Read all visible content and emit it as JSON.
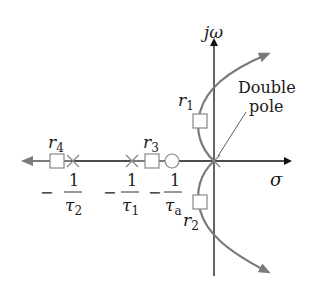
{
  "diagram": {
    "type": "root-locus",
    "axes": {
      "vertical": "jω",
      "horizontal": "σ"
    },
    "annotation": {
      "line1": "Double",
      "line2": "pole"
    },
    "roots": [
      {
        "id": "r1",
        "sym": "r",
        "sub": "1"
      },
      {
        "id": "r2",
        "sym": "r",
        "sub": "2"
      },
      {
        "id": "r3",
        "sym": "r",
        "sub": "3"
      },
      {
        "id": "r4",
        "sym": "r",
        "sub": "4"
      }
    ],
    "axis_labels": [
      {
        "sign": "−",
        "num": "1",
        "den_sym": "τ",
        "den_sub": "2"
      },
      {
        "sign": "−",
        "num": "1",
        "den_sym": "τ",
        "den_sub": "1"
      },
      {
        "sign": "−",
        "num": "1",
        "den_sym": "τ",
        "den_sub": "a"
      }
    ],
    "colors": {
      "locus": "#7a7a7a",
      "axis": "#111111",
      "marker": "#888888"
    }
  }
}
